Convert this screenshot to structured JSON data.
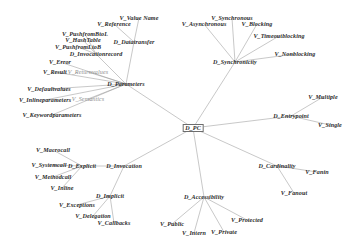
{
  "diagram": {
    "type": "radial-node-link-tree",
    "background_color": "#ffffff",
    "edge_color": "#9a9a9a",
    "label_color": "#2b2b2b",
    "width": 360,
    "height": 246,
    "nodes": [
      {
        "id": "D_PC",
        "label": "D_PC",
        "kind": "hub",
        "x": 193,
        "y": 128
      },
      {
        "id": "D_Parameters",
        "label": "D_Parameters",
        "kind": "dimension",
        "x": 126,
        "y": 84
      },
      {
        "id": "D_Synchronicity",
        "label": "D_Synchronicity",
        "kind": "dimension",
        "x": 235,
        "y": 62
      },
      {
        "id": "D_Entrypoint",
        "label": "D_Entrypoint",
        "kind": "dimension",
        "x": 291,
        "y": 116
      },
      {
        "id": "D_Cardinality",
        "label": "D_Cardinality",
        "kind": "dimension",
        "x": 277,
        "y": 166
      },
      {
        "id": "D_Accessibility",
        "label": "D_Accessibility",
        "kind": "dimension",
        "x": 204,
        "y": 197
      },
      {
        "id": "D_Invocation",
        "label": "D_Invocation",
        "kind": "dimension",
        "x": 124,
        "y": 166
      },
      {
        "id": "D_Explicit",
        "label": "D_Explicit",
        "kind": "dimension",
        "x": 82,
        "y": 166
      },
      {
        "id": "D_Implicit",
        "label": "D_Implicit",
        "kind": "dimension",
        "x": 110,
        "y": 196
      },
      {
        "id": "D_Datatransfer",
        "label": "D_Datatransfer",
        "kind": "dimension",
        "x": 134,
        "y": 42
      },
      {
        "id": "D_Invocationrecord",
        "label": "D_Invocationrecord",
        "kind": "dimension",
        "x": 96,
        "y": 54
      },
      {
        "id": "V_ValueName",
        "label": "V_Value Name",
        "kind": "value",
        "x": 139,
        "y": 18
      },
      {
        "id": "V_Reference",
        "label": "V_Reference",
        "kind": "value",
        "x": 114,
        "y": 24
      },
      {
        "id": "V_PushfromBtoL",
        "label": "V_PushfromBtoL",
        "kind": "value",
        "x": 85,
        "y": 34
      },
      {
        "id": "V_HashTable",
        "label": "V_HashTable",
        "kind": "value",
        "x": 83,
        "y": 40
      },
      {
        "id": "V_PushfromLtoB",
        "label": "V_PushfromLtoB",
        "kind": "value",
        "x": 78,
        "y": 47
      },
      {
        "id": "V_Error",
        "label": "V_Error",
        "kind": "value",
        "x": 60,
        "y": 62
      },
      {
        "id": "V_Result",
        "label": "V_Result",
        "kind": "value",
        "x": 55,
        "y": 72
      },
      {
        "id": "V_Returnvalues",
        "label": "V_Returnvalues",
        "kind": "value",
        "x": 88,
        "y": 72
      },
      {
        "id": "V_Defaultvalues",
        "label": "V_Defaultvalues",
        "kind": "value",
        "x": 49,
        "y": 89
      },
      {
        "id": "V_Inlineparameters",
        "label": "V_Inlineparameters",
        "kind": "value",
        "x": 45,
        "y": 100
      },
      {
        "id": "V_Semantics",
        "label": "V_Semantics",
        "kind": "value",
        "x": 88,
        "y": 99
      },
      {
        "id": "V_Keywordparameters",
        "label": "V_Keywordparameters",
        "kind": "value",
        "x": 52,
        "y": 115
      },
      {
        "id": "V_Asynchronous",
        "label": "V_Asynchronous",
        "kind": "value",
        "x": 204,
        "y": 24
      },
      {
        "id": "V_Synchronous",
        "label": "V_Synchronous",
        "kind": "value",
        "x": 232,
        "y": 18
      },
      {
        "id": "V_Blocking",
        "label": "V_Blocking",
        "kind": "value",
        "x": 257,
        "y": 24
      },
      {
        "id": "V_Timeoutblocking",
        "label": "V_Timeoutblocking",
        "kind": "value",
        "x": 279,
        "y": 36
      },
      {
        "id": "V_Nonblocking",
        "label": "V_Nonblocking",
        "kind": "value",
        "x": 295,
        "y": 54
      },
      {
        "id": "V_Multiple",
        "label": "V_Multiple",
        "kind": "value",
        "x": 323,
        "y": 97
      },
      {
        "id": "V_Single",
        "label": "V_Single",
        "kind": "value",
        "x": 330,
        "y": 125
      },
      {
        "id": "V_Fanin",
        "label": "V_Fanin",
        "kind": "value",
        "x": 317,
        "y": 172
      },
      {
        "id": "V_Fanout",
        "label": "V_Fanout",
        "kind": "value",
        "x": 294,
        "y": 193
      },
      {
        "id": "V_Public",
        "label": "V_Public",
        "kind": "value",
        "x": 172,
        "y": 224
      },
      {
        "id": "V_Intern",
        "label": "V_Intern",
        "kind": "value",
        "x": 194,
        "y": 233
      },
      {
        "id": "V_Private",
        "label": "V_Private",
        "kind": "value",
        "x": 224,
        "y": 232
      },
      {
        "id": "V_Protected",
        "label": "V_Protected",
        "kind": "value",
        "x": 247,
        "y": 220
      },
      {
        "id": "V_Macrocall",
        "label": "V_Macrocall",
        "kind": "value",
        "x": 53,
        "y": 150
      },
      {
        "id": "V_Systemcall",
        "label": "V_Systemcall",
        "kind": "value",
        "x": 49,
        "y": 165
      },
      {
        "id": "V_Methodcall",
        "label": "V_Methodcall",
        "kind": "value",
        "x": 53,
        "y": 177
      },
      {
        "id": "V_Inline",
        "label": "V_Inline",
        "kind": "value",
        "x": 62,
        "y": 188
      },
      {
        "id": "V_Exceptions",
        "label": "V_Exceptions",
        "kind": "value",
        "x": 77,
        "y": 205
      },
      {
        "id": "V_Delegation",
        "label": "V_Delegation",
        "kind": "value",
        "x": 93,
        "y": 216
      },
      {
        "id": "V_Callbacks",
        "label": "V_Callbacks",
        "kind": "value",
        "x": 114,
        "y": 223
      }
    ],
    "edges": [
      {
        "from": "D_PC",
        "to": "D_Parameters"
      },
      {
        "from": "D_PC",
        "to": "D_Synchronicity"
      },
      {
        "from": "D_PC",
        "to": "D_Entrypoint"
      },
      {
        "from": "D_PC",
        "to": "D_Cardinality"
      },
      {
        "from": "D_PC",
        "to": "D_Accessibility"
      },
      {
        "from": "D_PC",
        "to": "D_Invocation"
      },
      {
        "from": "D_Parameters",
        "to": "D_Datatransfer"
      },
      {
        "from": "D_Parameters",
        "to": "D_Invocationrecord"
      },
      {
        "from": "D_Parameters",
        "to": "V_Returnvalues"
      },
      {
        "from": "D_Parameters",
        "to": "V_Result"
      },
      {
        "from": "D_Parameters",
        "to": "V_Error"
      },
      {
        "from": "D_Parameters",
        "to": "V_Semantics"
      },
      {
        "from": "D_Parameters",
        "to": "V_Defaultvalues"
      },
      {
        "from": "D_Parameters",
        "to": "V_Inlineparameters"
      },
      {
        "from": "D_Parameters",
        "to": "V_Keywordparameters"
      },
      {
        "from": "D_Datatransfer",
        "to": "V_ValueName"
      },
      {
        "from": "D_Datatransfer",
        "to": "V_Reference"
      },
      {
        "from": "D_Invocationrecord",
        "to": "V_PushfromBtoL"
      },
      {
        "from": "D_Invocationrecord",
        "to": "V_HashTable"
      },
      {
        "from": "D_Invocationrecord",
        "to": "V_PushfromLtoB"
      },
      {
        "from": "D_Synchronicity",
        "to": "V_Asynchronous"
      },
      {
        "from": "D_Synchronicity",
        "to": "V_Synchronous"
      },
      {
        "from": "D_Synchronicity",
        "to": "V_Blocking"
      },
      {
        "from": "D_Synchronicity",
        "to": "V_Timeoutblocking"
      },
      {
        "from": "D_Synchronicity",
        "to": "V_Nonblocking"
      },
      {
        "from": "D_Entrypoint",
        "to": "V_Multiple"
      },
      {
        "from": "D_Entrypoint",
        "to": "V_Single"
      },
      {
        "from": "D_Cardinality",
        "to": "V_Fanin"
      },
      {
        "from": "D_Cardinality",
        "to": "V_Fanout"
      },
      {
        "from": "D_Accessibility",
        "to": "V_Public"
      },
      {
        "from": "D_Accessibility",
        "to": "V_Intern"
      },
      {
        "from": "D_Accessibility",
        "to": "V_Private"
      },
      {
        "from": "D_Accessibility",
        "to": "V_Protected"
      },
      {
        "from": "D_Invocation",
        "to": "D_Explicit"
      },
      {
        "from": "D_Invocation",
        "to": "D_Implicit"
      },
      {
        "from": "D_Explicit",
        "to": "V_Macrocall"
      },
      {
        "from": "D_Explicit",
        "to": "V_Systemcall"
      },
      {
        "from": "D_Explicit",
        "to": "V_Methodcall"
      },
      {
        "from": "D_Explicit",
        "to": "V_Inline"
      },
      {
        "from": "D_Implicit",
        "to": "V_Exceptions"
      },
      {
        "from": "D_Implicit",
        "to": "V_Delegation"
      },
      {
        "from": "D_Implicit",
        "to": "V_Callbacks"
      }
    ]
  }
}
